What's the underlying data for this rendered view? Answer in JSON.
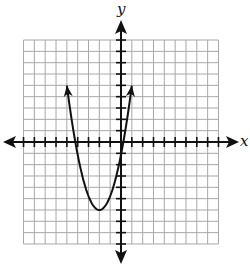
{
  "chart_data": {
    "type": "line",
    "title": "",
    "xlabel": "x",
    "ylabel": "y",
    "xlim": [
      -9,
      9
    ],
    "ylim": [
      -9,
      9
    ],
    "grid": true,
    "grid_step": 1,
    "legend": null,
    "series": [
      {
        "name": "parabola",
        "equation": "y = a(x + 2)^2 - 6",
        "a": 1.22,
        "vertex": [
          -2,
          -6
        ],
        "opens": "up",
        "arrow_ends": [
          [
            -5,
            5
          ],
          [
            1,
            5
          ]
        ],
        "x_intercepts": [
          -4.2,
          0.2
        ],
        "y_intercept": -1.1,
        "color": "#111111"
      }
    ]
  },
  "colors": {
    "grid": "#a8a8a8",
    "axis": "#111111",
    "curve": "#111111",
    "background": "#ffffff"
  },
  "labels": {
    "x_axis": "x",
    "y_axis": "y"
  }
}
